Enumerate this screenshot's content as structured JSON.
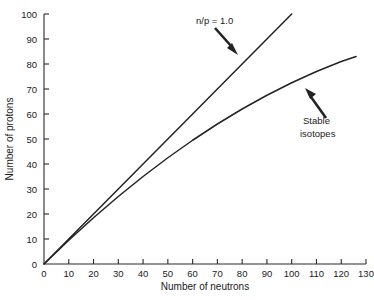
{
  "chart_data": {
    "type": "line",
    "title": "",
    "xlabel": "Number of neutrons",
    "ylabel": "Number of protons",
    "xlim": [
      0,
      130
    ],
    "ylim": [
      0,
      100
    ],
    "xticks": [
      0,
      10,
      20,
      30,
      40,
      50,
      60,
      70,
      80,
      90,
      100,
      110,
      120,
      130
    ],
    "yticks": [
      0,
      10,
      20,
      30,
      40,
      50,
      60,
      70,
      80,
      90,
      100
    ],
    "grid": false,
    "legend": "none",
    "series": [
      {
        "name": "n/p = 1.0",
        "x": [
          0,
          10,
          20,
          30,
          40,
          50,
          60,
          70,
          80,
          90,
          100
        ],
        "values": [
          0,
          10,
          20,
          30,
          40,
          50,
          60,
          70,
          80,
          90,
          100
        ]
      },
      {
        "name": "Stable isotopes",
        "x": [
          0,
          10,
          20,
          30,
          40,
          50,
          60,
          70,
          80,
          90,
          100,
          110,
          120,
          126
        ],
        "values": [
          0,
          9.5,
          18.5,
          27,
          35,
          42.5,
          49.5,
          56,
          62,
          67.5,
          72.5,
          77,
          81,
          83
        ]
      }
    ],
    "annotations": [
      {
        "id": "np-ratio",
        "text": "n/p = 1.0",
        "label_x": 196,
        "label_y": 24,
        "arrow_from": [
          215,
          28
        ],
        "arrow_to": [
          238,
          54
        ]
      },
      {
        "id": "stable-isotopes",
        "line1": "Stable",
        "line2": "isotopes",
        "label_x": 303,
        "label_y": 124,
        "arrow_from": [
          326,
          122
        ],
        "arrow_to": [
          306,
          90
        ]
      }
    ],
    "colors": {
      "line": "#232323",
      "axis": "#2b2b2b",
      "text": "#1a1a1a",
      "background": "#ffffff"
    }
  }
}
